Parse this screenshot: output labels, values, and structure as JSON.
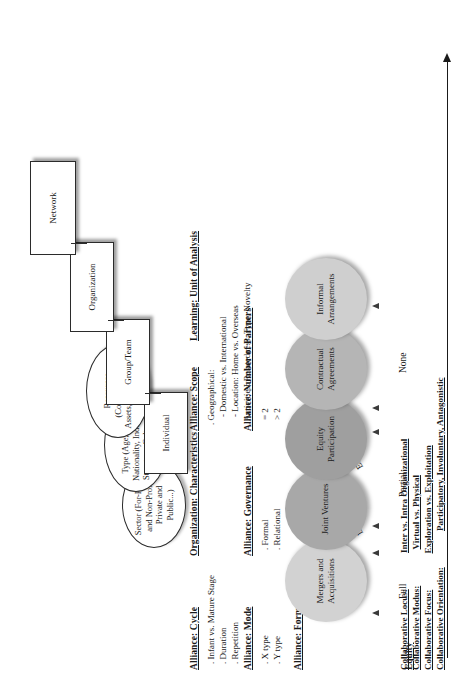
{
  "figure": {
    "orientation": "rotated-90-ccw"
  },
  "equity_axis": {
    "label": "Equity",
    "levels": [
      {
        "name": "Full"
      },
      {
        "name": "Partial"
      },
      {
        "name": "None"
      }
    ],
    "origin_labels": [
      {
        "name": "De Novo"
      },
      {
        "name": "Existing"
      }
    ]
  },
  "alliance_form": {
    "header": "Alliance: Form",
    "items": [
      {
        "label": "Mergers and Acquisitions",
        "color": "#d2d2d2"
      },
      {
        "label": "Joint Ventures",
        "color": "#a8a8a8"
      },
      {
        "label": "Equity Participation",
        "color": "#9f9f9f"
      },
      {
        "label": "Contractual Agreements",
        "color": "#b5b5b5"
      },
      {
        "label": "Informal Arrangements",
        "color": "#cfcfcf"
      }
    ]
  },
  "alliance_mode": {
    "header": "Alliance: Mode",
    "items": [
      ". X type",
      ". Y type"
    ]
  },
  "alliance_governance": {
    "header": "Alliance: Governance",
    "items": [
      ". Formal",
      ". Relational"
    ]
  },
  "alliance_cycle": {
    "header": "Alliance: Cycle",
    "items": [
      ". Infant vs. Mature Stage",
      ". Duration",
      ". Repetition"
    ]
  },
  "alliance_partners": {
    "header": "Alliance: Number of Partners",
    "items": [
      "= 2",
      "> 2"
    ]
  },
  "alliance_scope": {
    "header": "Alliance: Scope",
    "items": [
      ". Geographical:",
      "- Domestic vs. International",
      "- Location: Home vs. Overseas",
      ". Activities: Relatedness, Type, Novelty"
    ]
  },
  "organization_characteristics": {
    "header": "Organization: Characteristics",
    "items": [
      "Sector (For-Profit and Non-Profit, Private and Public...)",
      "Type (Age, Size, Nationality, Industry, Structure, Culture...)",
      "Resources (Competencies, Assets, Technology...)"
    ]
  },
  "learning_unit": {
    "header": "Learning: Unit of Analysis",
    "items": [
      "Individual",
      "Group/Team",
      "Organization",
      "Network"
    ]
  },
  "collaborative": {
    "rows": [
      {
        "key": "Collaborative Locus:",
        "value": "Inter vs. Intra Organizational"
      },
      {
        "key": "Collaborative Modus:",
        "value": "Virtual vs. Physical"
      },
      {
        "key": "Collaborative Focus:",
        "value": "Exploration vs. Exploitation"
      },
      {
        "key": "Collaborative Orientation:",
        "value": "Participatory, Involuntary, Antagonistic"
      }
    ]
  }
}
